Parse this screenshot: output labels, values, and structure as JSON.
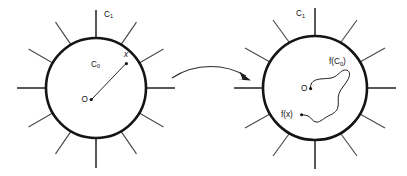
{
  "figure": {
    "background_color": "#ffffff",
    "stroke_color": "#141414",
    "spoke_color": "#4a4a4a",
    "point_color": "#111111",
    "left_panel": {
      "name": "domain-disk",
      "circle": {
        "cx": 96,
        "cy": 88,
        "r": 50
      },
      "boundary_label": "C",
      "boundary_subscript": "1",
      "interior_label": "C",
      "interior_subscript": "0",
      "center_label": "O",
      "point_label": "x",
      "spoke_count": 12
    },
    "right_panel": {
      "name": "image-disk",
      "circle": {
        "cx": 315,
        "cy": 88,
        "r": 52
      },
      "boundary_label": "C",
      "boundary_subscript": "1",
      "interior_label": "f(C",
      "interior_subscript": "0",
      "interior_label_close": ")",
      "center_label": "O",
      "point_label": "f(x)",
      "spoke_count": 12
    },
    "mapping_arrow": {
      "name": "mapping-arrow",
      "label": ""
    }
  }
}
